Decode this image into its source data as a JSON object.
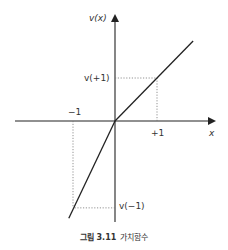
{
  "chart_data": {
    "type": "line",
    "title": "",
    "xlabel": "x",
    "ylabel": "v(x)",
    "xlim": [
      -1.0,
      1.0
    ],
    "points": [
      {
        "x": -1.1,
        "y": -2.26
      },
      {
        "x": 0,
        "y": 0
      },
      {
        "x": 1.86,
        "y": 1.86
      }
    ],
    "series": [
      {
        "name": "value function (loss side)",
        "x": [
          -1.1,
          0
        ],
        "y": [
          -2.26,
          0
        ]
      },
      {
        "name": "value function (gain side)",
        "x": [
          0,
          1.86
        ],
        "y": [
          0,
          1.86
        ]
      }
    ],
    "x_tick_labels": [
      "-1",
      "+1"
    ],
    "annotations": [
      {
        "label": "v(+1)",
        "x": 1,
        "y": 1
      },
      {
        "label": "v(-1)",
        "x": -1,
        "y": -2.02
      }
    ],
    "grid": false,
    "legend": "none"
  },
  "labels": {
    "y_axis": "v(x)",
    "x_axis": "x",
    "tick_minus_one": "−1",
    "tick_plus_one": "+1",
    "v_plus_one": "v(+1)",
    "v_minus_one": "v(−1)"
  },
  "caption": {
    "number": "그림 3.11",
    "text": "가치함수"
  }
}
